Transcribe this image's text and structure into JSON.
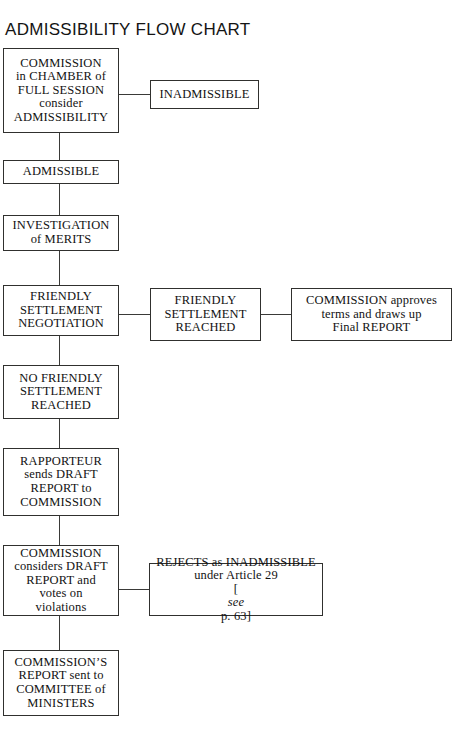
{
  "title": "ADMISSIBILITY FLOW CHART",
  "colors": {
    "background": "#ffffff",
    "border": "#30302e",
    "text": "#121212",
    "connector": "#3a3a38"
  },
  "nodes": {
    "commission_chamber": {
      "lines": [
        "COMMISSION",
        "in CHAMBER of",
        "FULL SESSION",
        "consider",
        "ADMISSIBILITY"
      ],
      "text": "COMMISSION in CHAMBER of FULL SESSION consider ADMISSIBILITY"
    },
    "inadmissible": {
      "lines": [
        "INADMISSIBLE"
      ],
      "text": "INADMISSIBLE"
    },
    "admissible": {
      "lines": [
        "ADMISSIBLE"
      ],
      "text": "ADMISSIBLE"
    },
    "investigation_merits": {
      "lines": [
        "INVESTIGATION",
        "of MERITS"
      ],
      "text": "INVESTIGATION of MERITS"
    },
    "friendly_settlement_negotiation": {
      "lines": [
        "FRIENDLY",
        "SETTLEMENT",
        "NEGOTIATION"
      ],
      "text": "FRIENDLY SETTLEMENT NEGOTIATION"
    },
    "friendly_settlement_reached": {
      "lines": [
        "FRIENDLY",
        "SETTLEMENT",
        "REACHED"
      ],
      "text": "FRIENDLY SETTLEMENT REACHED"
    },
    "commission_approves": {
      "lines": [
        "COMMISSION approves",
        "terms and draws up",
        "Final REPORT"
      ],
      "text": "COMMISSION approves terms and draws up Final REPORT"
    },
    "no_friendly_settlement": {
      "lines": [
        "NO FRIENDLY",
        "SETTLEMENT",
        "REACHED"
      ],
      "text": "NO FRIENDLY SETTLEMENT REACHED"
    },
    "rapporteur": {
      "lines": [
        "RAPPORTEUR",
        "sends DRAFT",
        "REPORT to",
        "COMMISSION"
      ],
      "text": "RAPPORTEUR sends DRAFT REPORT to COMMISSION"
    },
    "commission_considers": {
      "lines": [
        "COMMISSION",
        "considers DRAFT",
        "REPORT and",
        "votes on",
        "violations"
      ],
      "text": "COMMISSION considers DRAFT REPORT and votes on violations"
    },
    "rejects_inadmissible": {
      "lines": [
        "REJECTS as INADMISSIBLE",
        "under Article 29"
      ],
      "line3_bracket_open": "[",
      "line3_italic": "see",
      "line3_rest": " p. 63]",
      "text": "REJECTS as INADMISSIBLE under Article 29 [see p. 63]"
    },
    "commission_report_sent": {
      "lines": [
        "COMMISSION’S",
        "REPORT sent to",
        "COMMITTEE of",
        "MINISTERS"
      ],
      "text": "COMMISSION’S REPORT sent to COMMITTEE of MINISTERS"
    }
  },
  "flow": {
    "edges": [
      {
        "from": "commission_chamber",
        "to": "inadmissible",
        "direction": "right"
      },
      {
        "from": "commission_chamber",
        "to": "admissible",
        "direction": "down"
      },
      {
        "from": "admissible",
        "to": "investigation_merits",
        "direction": "down"
      },
      {
        "from": "investigation_merits",
        "to": "friendly_settlement_negotiation",
        "direction": "down"
      },
      {
        "from": "friendly_settlement_negotiation",
        "to": "friendly_settlement_reached",
        "direction": "right"
      },
      {
        "from": "friendly_settlement_reached",
        "to": "commission_approves",
        "direction": "right"
      },
      {
        "from": "friendly_settlement_negotiation",
        "to": "no_friendly_settlement",
        "direction": "down"
      },
      {
        "from": "no_friendly_settlement",
        "to": "rapporteur",
        "direction": "down"
      },
      {
        "from": "rapporteur",
        "to": "commission_considers",
        "direction": "down"
      },
      {
        "from": "commission_considers",
        "to": "rejects_inadmissible",
        "direction": "right"
      },
      {
        "from": "commission_considers",
        "to": "commission_report_sent",
        "direction": "down"
      }
    ]
  }
}
